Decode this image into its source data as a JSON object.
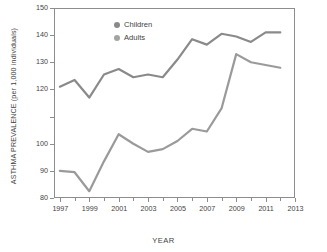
{
  "chart_data": {
    "type": "line",
    "title": "",
    "xlabel": "YEAR",
    "ylabel": "ASTHMA PREVALENCE (per 1,000 individuals)",
    "x": [
      1997,
      1998,
      1999,
      2000,
      2001,
      2002,
      2003,
      2004,
      2005,
      2006,
      2007,
      2008,
      2009,
      2010,
      2011,
      2012
    ],
    "xlim": [
      1996.6,
      2013.0
    ],
    "ylim": [
      80,
      150
    ],
    "grid": false,
    "legend_position": "top-left",
    "x_tick_labels": [
      "1997",
      "1999",
      "2001",
      "2003",
      "2005",
      "2007",
      "2009",
      "2011",
      "2013"
    ],
    "x_tick_values": [
      1997,
      1999,
      2001,
      2003,
      2005,
      2007,
      2009,
      2011,
      2013
    ],
    "x_minor_tick_values": [
      1998,
      2000,
      2002,
      2004,
      2006,
      2008,
      2010,
      2012
    ],
    "y_tick_values": [
      80,
      90,
      100,
      110,
      120,
      130,
      140,
      150
    ],
    "y_tick_labels": [
      "80",
      "90",
      "100",
      "",
      "120",
      "130",
      "140",
      "150"
    ],
    "series": [
      {
        "name": "Children",
        "color": "#8a8a8a",
        "values": [
          121.0,
          123.5,
          117.0,
          125.5,
          127.5,
          124.5,
          125.5,
          124.5,
          131.0,
          138.5,
          136.5,
          140.5,
          139.5,
          137.5,
          141.0,
          141.0
        ]
      },
      {
        "name": "Adults",
        "color": "#9a9a9a",
        "values": [
          90.0,
          89.5,
          82.5,
          93.5,
          103.5,
          100.0,
          97.0,
          98.0,
          101.0,
          105.5,
          104.5,
          113.0,
          133.0,
          130.0,
          129.0,
          128.0
        ]
      }
    ]
  },
  "legend": {
    "items": [
      {
        "label": "Children",
        "color": "#8a8a8a"
      },
      {
        "label": "Adults",
        "color": "#a3a3a3"
      }
    ]
  },
  "colors": {
    "axis": "#8d8d8d",
    "text": "#3f3f3f",
    "background": "#ffffff"
  }
}
